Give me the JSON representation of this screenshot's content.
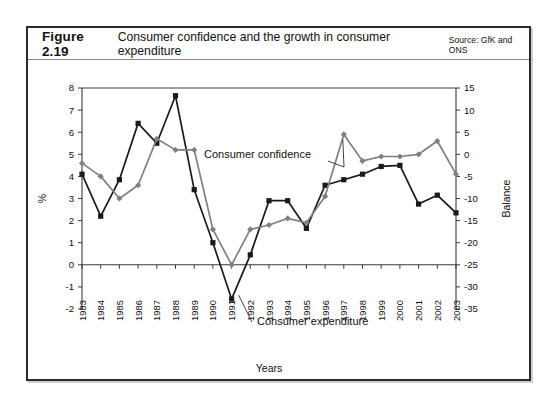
{
  "figure": {
    "number": "Figure 2.19",
    "title": "Consumer confidence and the growth in consumer expenditure",
    "source": "Source: GfK and ONS"
  },
  "annotations": {
    "confidence_label": "Consumer confidence",
    "expenditure_label": "Consumer expenditure"
  },
  "chart_data": {
    "type": "line",
    "title": "Consumer confidence and the growth in consumer expenditure",
    "subtitle": "Source: GfK and ONS",
    "xlabel": "Years",
    "ylabel": "%",
    "y2label": "Balance",
    "ylim": [
      -2,
      8
    ],
    "y2lim": [
      -35,
      15
    ],
    "grid": false,
    "legend": "inline-annotations",
    "x": [
      "1983",
      "1984",
      "1985",
      "1986",
      "1987",
      "1988",
      "1989",
      "1990",
      "1991",
      "1992",
      "1993",
      "1994",
      "1995",
      "1996",
      "1997",
      "1998",
      "1999",
      "2000",
      "2001",
      "2002",
      "2003"
    ],
    "yticks": [
      -2,
      -1,
      0,
      1,
      2,
      3,
      4,
      5,
      6,
      7,
      8
    ],
    "y2ticks": [
      -35,
      -30,
      -25,
      -20,
      -15,
      -10,
      -5,
      0,
      5,
      10,
      15
    ],
    "series": [
      {
        "name": "Consumer expenditure",
        "axis": "left",
        "unit": "%",
        "color": "#1a1a1a",
        "marker": "square",
        "values": [
          4.1,
          2.2,
          3.85,
          6.4,
          5.5,
          7.65,
          3.4,
          1.0,
          -1.55,
          0.45,
          2.9,
          2.9,
          1.65,
          3.6,
          3.85,
          4.1,
          4.45,
          4.5,
          2.75,
          3.15,
          2.35
        ]
      },
      {
        "name": "Consumer confidence",
        "axis": "right",
        "unit": "Balance",
        "color": "#808080",
        "marker": "diamond",
        "values": [
          -2,
          -5,
          -10,
          -7,
          3.5,
          1,
          1,
          -17,
          -25,
          -17,
          -16,
          -14.5,
          -15.5,
          -9.5,
          4.5,
          -1.5,
          -0.5,
          -0.5,
          0,
          3,
          -4.5
        ]
      }
    ]
  }
}
